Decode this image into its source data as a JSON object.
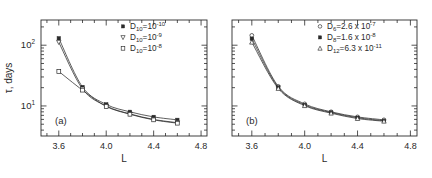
{
  "figure": {
    "panels": [
      {
        "tag": "(a)",
        "legend": [
          {
            "marker": "filled-square",
            "label": "D",
            "sub": "10",
            "eq": "=10",
            "exp": "-10"
          },
          {
            "marker": "down-triangle",
            "label": "D",
            "sub": "10",
            "eq": "=10",
            "exp": "-9"
          },
          {
            "marker": "open-square",
            "label": "D",
            "sub": "10",
            "eq": "=10",
            "exp": "-8"
          }
        ]
      },
      {
        "tag": "(b)",
        "legend": [
          {
            "marker": "open-circle",
            "label": "D",
            "sub": "6",
            "eq": "=2.6 x 10",
            "exp": "-7"
          },
          {
            "marker": "filled-square",
            "label": "D",
            "sub": "8",
            "eq": "=1.6 x 10",
            "exp": "-8"
          },
          {
            "marker": "open-triangle",
            "label": "D",
            "sub": "12",
            "eq": "=6.3 x 10",
            "exp": "-11"
          }
        ]
      }
    ],
    "axis": {
      "xlabel": "L",
      "ylabel_tau": "τ",
      "ylabel_rest": ", days",
      "xticklabels": [
        "3.6",
        "4.0",
        "4.4",
        "4.8"
      ],
      "yticklabels": [
        "10",
        "10"
      ],
      "yexp": [
        "1",
        "2"
      ]
    }
  },
  "chart_data": {
    "type": "scatter",
    "title": "",
    "xlabel": "L",
    "ylabel": "τ, days",
    "xlim": [
      3.45,
      4.85
    ],
    "ylim": [
      3.2,
      260
    ],
    "yscale": "log",
    "xticks": [
      3.6,
      4.0,
      4.4,
      4.8
    ],
    "yticks": [
      10,
      100
    ],
    "grid": false,
    "legend_position": "upper-right",
    "panels": [
      {
        "tag": "(a)",
        "x": [
          3.6,
          3.8,
          4.0,
          4.2,
          4.4,
          4.6
        ],
        "series": [
          {
            "name": "D10 = 1e-10",
            "marker": "filled-square",
            "values": [
              130,
              20.5,
              10.6,
              8.0,
              6.6,
              5.9
            ]
          },
          {
            "name": "D10 = 1e-9",
            "marker": "down-triangle",
            "values": [
              112,
              19.0,
              10.0,
              7.4,
              6.0,
              5.3
            ]
          },
          {
            "name": "D10 = 1e-8",
            "marker": "open-square",
            "values": [
              37,
              18.2,
              9.8,
              7.3,
              5.9,
              5.2
            ]
          }
        ]
      },
      {
        "tag": "(b)",
        "x": [
          3.6,
          3.8,
          4.0,
          4.2,
          4.4,
          4.6
        ],
        "series": [
          {
            "name": "D6 = 2.6e-7",
            "marker": "open-circle",
            "values": [
              145,
              21.0,
              10.8,
              8.0,
              6.6,
              5.9
            ]
          },
          {
            "name": "D8 = 1.6e-8",
            "marker": "filled-square",
            "values": [
              128,
              20.2,
              10.4,
              7.8,
              6.4,
              5.7
            ]
          },
          {
            "name": "D12 = 6.3e-11",
            "marker": "open-triangle",
            "values": [
              112,
              19.4,
              10.1,
              7.6,
              6.2,
              5.6
            ]
          }
        ]
      }
    ]
  }
}
